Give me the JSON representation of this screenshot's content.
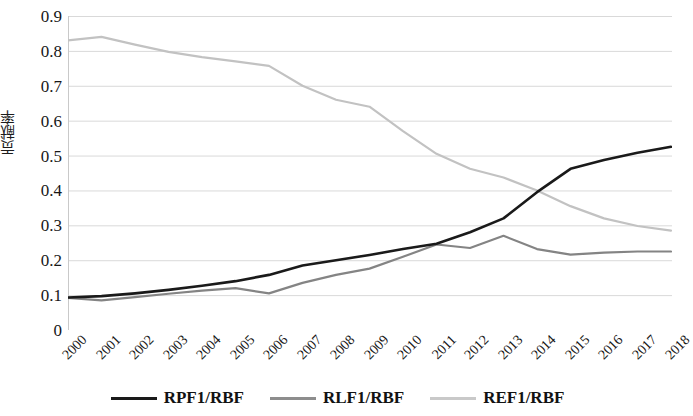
{
  "chart_data": {
    "type": "line",
    "title": "",
    "xlabel": "",
    "ylabel": "贡献率",
    "ylim": [
      0,
      0.9
    ],
    "ytick_step": 0.1,
    "ytick_labels": [
      "0.9",
      "0.8",
      "0.7",
      "0.6",
      "0.5",
      "0.4",
      "0.3",
      "0.2",
      "0.1",
      "0"
    ],
    "ytick_values": [
      0.9,
      0.8,
      0.7,
      0.6,
      0.5,
      0.4,
      0.3,
      0.2,
      0.1,
      0
    ],
    "grid": "horizontal",
    "legend_position": "bottom",
    "categories": [
      "2000",
      "2001",
      "2002",
      "2003",
      "2004",
      "2005",
      "2006",
      "2007",
      "2008",
      "2009",
      "2010",
      "2011",
      "2012",
      "2013",
      "2014",
      "2015",
      "2016",
      "2017",
      "2018"
    ],
    "series": [
      {
        "name": "RPF1/RBF",
        "color": "#1a1a1a",
        "width": 2.6,
        "values": [
          0.093,
          0.097,
          0.105,
          0.115,
          0.127,
          0.14,
          0.158,
          0.185,
          0.2,
          0.215,
          0.232,
          0.247,
          0.28,
          0.32,
          0.395,
          0.462,
          0.487,
          0.508,
          0.525
        ]
      },
      {
        "name": "RLF1/RBF",
        "color": "#848484",
        "width": 2.2,
        "values": [
          0.092,
          0.085,
          0.094,
          0.104,
          0.113,
          0.12,
          0.105,
          0.135,
          0.158,
          0.176,
          0.21,
          0.245,
          0.235,
          0.27,
          0.232,
          0.216,
          0.222,
          0.225,
          0.225
        ]
      },
      {
        "name": "REF1/RBF",
        "color": "#c2c2c2",
        "width": 2.2,
        "values": [
          0.83,
          0.84,
          0.818,
          0.797,
          0.782,
          0.77,
          0.757,
          0.7,
          0.66,
          0.64,
          0.57,
          0.505,
          0.462,
          0.437,
          0.4,
          0.355,
          0.32,
          0.298,
          0.285
        ]
      }
    ]
  },
  "legend": {
    "items": [
      {
        "label": "RPF1/RBF",
        "color": "#1a1a1a",
        "width": 3.4
      },
      {
        "label": "RLF1/RBF",
        "color": "#8d8d8d",
        "width": 3.0
      },
      {
        "label": "REF1/RBF",
        "color": "#c9c9c9",
        "width": 3.0
      }
    ]
  },
  "style": {
    "grid_color": "#d9d9d9",
    "axis_color": "#c9c9c9",
    "background": "#ffffff"
  }
}
